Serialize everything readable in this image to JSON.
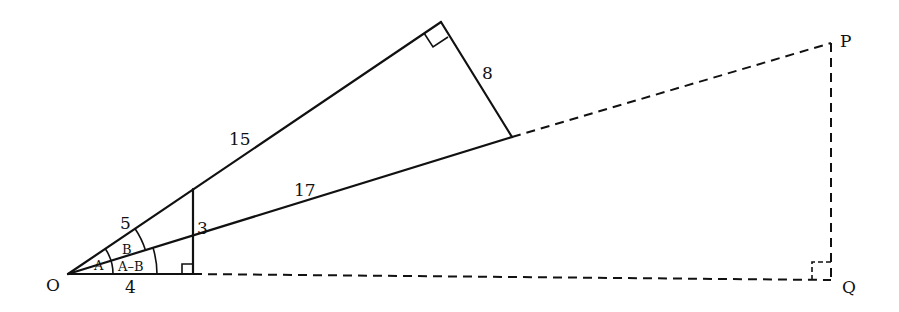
{
  "diagram": {
    "points": {
      "O": {
        "label": "O",
        "x": 68,
        "y": 274
      },
      "P": {
        "label": "P",
        "x": 831,
        "y": 43
      },
      "Q": {
        "label": "Q",
        "x": 831,
        "y": 280
      }
    },
    "side_labels": {
      "hyp_small": "5",
      "opp_small": "3",
      "adj_small": "4",
      "long_leg": "15",
      "short_leg": "8",
      "hyp_large": "17"
    },
    "angle_labels": {
      "A": "A",
      "B": "B",
      "A_minus_B": "A–B"
    },
    "line_color": "#111111",
    "background": "#ffffff"
  }
}
